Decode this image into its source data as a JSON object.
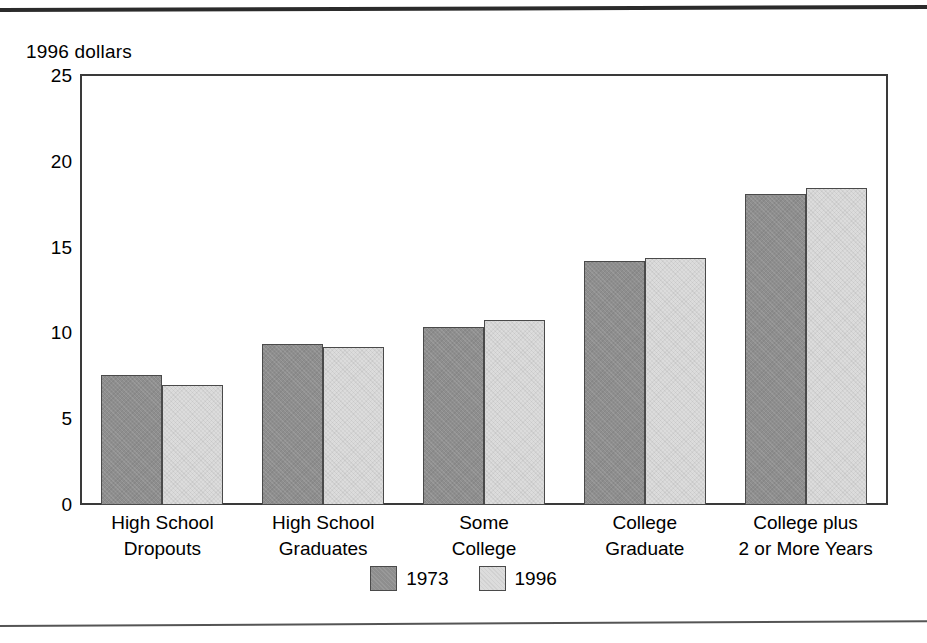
{
  "page": {
    "top_rule": "horizontal-rule",
    "bottom_rule": "horizontal-rule"
  },
  "chart_data": {
    "type": "bar",
    "title": "",
    "subtitle": "",
    "xlabel": "",
    "ylabel": "1996 dollars",
    "categories": [
      "High School\nDropouts",
      "High School\nGraduates",
      "Some\nCollege",
      "College\nGraduate",
      "College plus\n2 or More Years"
    ],
    "category_lines": [
      [
        "High School",
        "Dropouts"
      ],
      [
        "High School",
        "Graduates"
      ],
      [
        "Some",
        "College"
      ],
      [
        "College",
        "Graduate"
      ],
      [
        "College plus",
        "2 or More Years"
      ]
    ],
    "series": [
      {
        "name": "1973",
        "color": "#8e8e8e",
        "values": [
          7.6,
          9.4,
          10.4,
          14.2,
          18.1
        ]
      },
      {
        "name": "1996",
        "color": "#dcdcdc",
        "values": [
          7.0,
          9.2,
          10.8,
          14.4,
          18.5
        ]
      }
    ],
    "ylim": [
      0,
      25
    ],
    "ytick_labels": [
      "0",
      "5",
      "10",
      "15",
      "20",
      "25"
    ],
    "ytick_values": [
      0,
      5,
      10,
      15,
      20,
      25
    ],
    "yminor_values": [
      2.5,
      7.5,
      12.5,
      17.5,
      22.5
    ],
    "grid": false,
    "legend_position": "bottom-center",
    "legend_entries": [
      "1973",
      "1996"
    ]
  },
  "axis_caption": "1996 dollars",
  "legend": {
    "items": [
      {
        "label": "1973",
        "swatch": "dark-gray-swatch"
      },
      {
        "label": "1996",
        "swatch": "light-gray-swatch"
      }
    ]
  }
}
